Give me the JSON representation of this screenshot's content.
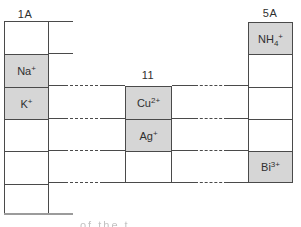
{
  "figure": {
    "group_labels": {
      "left": "1A",
      "middle": "11",
      "right": "5A"
    },
    "ions": {
      "na": {
        "base": "Na",
        "sub": "",
        "sup": "+"
      },
      "k": {
        "base": "K",
        "sub": "",
        "sup": "+"
      },
      "cu": {
        "base": "Cu",
        "sub": "",
        "sup": "2+"
      },
      "ag": {
        "base": "Ag",
        "sub": "",
        "sup": "+"
      },
      "nh4": {
        "base": "NH",
        "sub": "4",
        "sup": "+"
      },
      "bi": {
        "base": "Bi",
        "sub": "",
        "sup": "3+"
      }
    },
    "caption_fragment": "of the t",
    "colors": {
      "cell_fill": "#d6d6d6",
      "grid_line": "#4a4a4a",
      "text": "#2f2f2f",
      "shadow_line": "#9b9b9b"
    }
  }
}
